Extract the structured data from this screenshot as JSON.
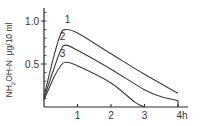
{
  "chart_data": {
    "type": "line",
    "title": "",
    "xlabel": "h",
    "ylabel": "NH2OH-N μg/10 ml",
    "xlim": [
      0,
      4.3
    ],
    "ylim": [
      0,
      1.15
    ],
    "x_ticks": [
      1,
      2,
      3,
      4
    ],
    "x_tick_labels": [
      "1",
      "2",
      "3",
      "4h"
    ],
    "y_ticks": [
      0.5,
      1.0
    ],
    "y_tick_labels": [
      "0.5",
      "1.0"
    ],
    "grid": false,
    "legend": "inline curve labels",
    "series": [
      {
        "name": "1",
        "x": [
          0,
          0.3,
          0.5,
          0.65,
          1,
          2,
          3,
          4
        ],
        "y": [
          0.12,
          0.6,
          0.85,
          0.9,
          0.86,
          0.62,
          0.38,
          0.16
        ]
      },
      {
        "name": "2",
        "x": [
          0,
          0.3,
          0.5,
          0.65,
          1,
          2,
          3,
          3.5,
          4,
          4
        ],
        "y": [
          0.1,
          0.45,
          0.66,
          0.72,
          0.66,
          0.44,
          0.2,
          0.12,
          0.07,
          0
        ]
      },
      {
        "name": "3",
        "x": [
          0,
          0.3,
          0.5,
          0.65,
          1,
          2,
          2.7,
          3
        ],
        "y": [
          0.08,
          0.35,
          0.48,
          0.52,
          0.48,
          0.28,
          0.06,
          0
        ]
      }
    ],
    "curve_label_positions": [
      {
        "label": "1",
        "x": 0.7,
        "y": 0.98
      },
      {
        "label": "2",
        "x": 0.55,
        "y": 0.78
      },
      {
        "label": "3",
        "x": 0.55,
        "y": 0.58
      }
    ]
  },
  "colors": {
    "line": "#3a3a3a",
    "axis": "#2a2a2a",
    "text": "#333333"
  }
}
